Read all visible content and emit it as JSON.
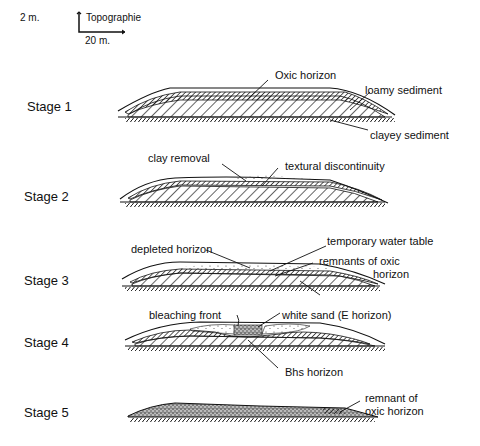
{
  "scale": {
    "vertical": "2 m.",
    "horizontal": "20 m.",
    "caption": "Topographie"
  },
  "stages": [
    {
      "label": "Stage 1",
      "annotations": [
        "Oxic horizon",
        "loamy sediment",
        "clayey sediment"
      ]
    },
    {
      "label": "Stage 2",
      "annotations": [
        "clay removal",
        "textural discontinuity"
      ]
    },
    {
      "label": "Stage 3",
      "annotations": [
        "depleted horizon",
        "temporary water table",
        "remnants of oxic",
        "horizon"
      ]
    },
    {
      "label": "Stage 4",
      "annotations": [
        "bleaching front",
        "white sand (E horizon)",
        "Bhs horizon"
      ]
    },
    {
      "label": "Stage 5",
      "annotations": [
        "remnant of",
        "oxic horizon"
      ]
    }
  ]
}
